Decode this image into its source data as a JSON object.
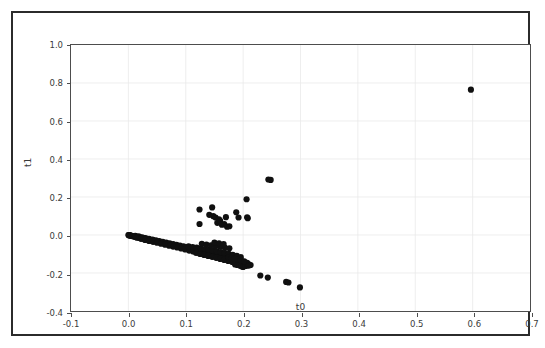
{
  "figure": {
    "background_color": "#ffffff",
    "frame_color": "#2b2b2b",
    "axes_color": "#4d4d4d",
    "grid_color": "#e9e9e9",
    "marker_color": "#101010"
  },
  "chart_data": {
    "type": "scatter",
    "title": "",
    "xlabel": "t0",
    "ylabel": "t1",
    "xlim": [
      -0.1,
      0.7
    ],
    "ylim": [
      -0.4,
      1.0
    ],
    "xticks": [
      -0.1,
      0.0,
      0.1,
      0.2,
      0.3,
      0.4,
      0.5,
      0.6,
      0.7
    ],
    "xticklabels": [
      "-0.1",
      "0.0",
      "0.1",
      "0.2",
      "0.3",
      "0.4",
      "0.5",
      "0.6",
      "0.7"
    ],
    "yticks": [
      -0.4,
      -0.2,
      0.0,
      0.2,
      0.4,
      0.6,
      0.8,
      1.0
    ],
    "yticklabels": [
      "-0.4",
      "-0.2",
      "0.0",
      "0.2",
      "0.4",
      "0.6",
      "0.8",
      "1.0"
    ],
    "grid": true,
    "legend": null,
    "marker": "o",
    "marker_size": 3.1,
    "series": [
      {
        "name": "points",
        "color": "#101010",
        "points": [
          [
            0.0,
            0.0
          ],
          [
            0.001,
            -0.001
          ],
          [
            0.002,
            -0.002
          ],
          [
            0.003,
            -0.002
          ],
          [
            0.004,
            -0.003
          ],
          [
            0.005,
            -0.004
          ],
          [
            0.006,
            -0.004
          ],
          [
            0.007,
            -0.005
          ],
          [
            0.008,
            -0.006
          ],
          [
            0.009,
            -0.006
          ],
          [
            0.01,
            -0.007
          ],
          [
            0.011,
            -0.008
          ],
          [
            0.012,
            -0.008
          ],
          [
            0.013,
            -0.009
          ],
          [
            0.014,
            -0.01
          ],
          [
            0.015,
            -0.01
          ],
          [
            0.016,
            -0.011
          ],
          [
            0.017,
            -0.012
          ],
          [
            0.018,
            -0.012
          ],
          [
            0.019,
            -0.013
          ],
          [
            0.02,
            -0.014
          ],
          [
            0.021,
            -0.014
          ],
          [
            0.022,
            -0.015
          ],
          [
            0.023,
            -0.016
          ],
          [
            0.024,
            -0.016
          ],
          [
            0.025,
            -0.017
          ],
          [
            0.026,
            -0.018
          ],
          [
            0.027,
            -0.018
          ],
          [
            0.028,
            -0.019
          ],
          [
            0.029,
            -0.02
          ],
          [
            0.03,
            -0.021
          ],
          [
            0.031,
            -0.021
          ],
          [
            0.032,
            -0.022
          ],
          [
            0.033,
            -0.023
          ],
          [
            0.034,
            -0.023
          ],
          [
            0.035,
            -0.024
          ],
          [
            0.036,
            -0.025
          ],
          [
            0.037,
            -0.025
          ],
          [
            0.038,
            -0.026
          ],
          [
            0.039,
            -0.027
          ],
          [
            0.04,
            -0.027
          ],
          [
            0.041,
            -0.028
          ],
          [
            0.042,
            -0.029
          ],
          [
            0.043,
            -0.03
          ],
          [
            0.044,
            -0.03
          ],
          [
            0.045,
            -0.031
          ],
          [
            0.046,
            -0.032
          ],
          [
            0.047,
            -0.032
          ],
          [
            0.048,
            -0.033
          ],
          [
            0.049,
            -0.034
          ],
          [
            0.05,
            -0.034
          ],
          [
            0.051,
            -0.035
          ],
          [
            0.052,
            -0.036
          ],
          [
            0.053,
            -0.037
          ],
          [
            0.054,
            -0.037
          ],
          [
            0.055,
            -0.038
          ],
          [
            0.056,
            -0.039
          ],
          [
            0.057,
            -0.039
          ],
          [
            0.058,
            -0.04
          ],
          [
            0.059,
            -0.041
          ],
          [
            0.06,
            -0.041
          ],
          [
            0.061,
            -0.042
          ],
          [
            0.062,
            -0.043
          ],
          [
            0.063,
            -0.044
          ],
          [
            0.064,
            -0.044
          ],
          [
            0.065,
            -0.045
          ],
          [
            0.066,
            -0.046
          ],
          [
            0.067,
            -0.046
          ],
          [
            0.068,
            -0.047
          ],
          [
            0.069,
            -0.048
          ],
          [
            0.07,
            -0.048
          ],
          [
            0.071,
            -0.049
          ],
          [
            0.072,
            -0.05
          ],
          [
            0.073,
            -0.051
          ],
          [
            0.074,
            -0.051
          ],
          [
            0.075,
            -0.052
          ],
          [
            0.076,
            -0.053
          ],
          [
            0.077,
            -0.053
          ],
          [
            0.078,
            -0.054
          ],
          [
            0.079,
            -0.055
          ],
          [
            0.08,
            -0.056
          ],
          [
            0.081,
            -0.056
          ],
          [
            0.082,
            -0.057
          ],
          [
            0.083,
            -0.058
          ],
          [
            0.084,
            -0.058
          ],
          [
            0.085,
            -0.059
          ],
          [
            0.086,
            -0.06
          ],
          [
            0.087,
            -0.06
          ],
          [
            0.088,
            -0.061
          ],
          [
            0.089,
            -0.062
          ],
          [
            0.09,
            -0.063
          ],
          [
            0.091,
            -0.063
          ],
          [
            0.092,
            -0.064
          ],
          [
            0.093,
            -0.065
          ],
          [
            0.094,
            -0.065
          ],
          [
            0.095,
            -0.066
          ],
          [
            0.096,
            -0.067
          ],
          [
            0.097,
            -0.067
          ],
          [
            0.098,
            -0.068
          ],
          [
            0.099,
            -0.069
          ],
          [
            0.1,
            -0.07
          ],
          [
            0.102,
            -0.071
          ],
          [
            0.104,
            -0.072
          ],
          [
            0.106,
            -0.074
          ],
          [
            0.108,
            -0.075
          ],
          [
            0.11,
            -0.077
          ],
          [
            0.112,
            -0.078
          ],
          [
            0.114,
            -0.08
          ],
          [
            0.116,
            -0.081
          ],
          [
            0.118,
            -0.083
          ],
          [
            0.12,
            -0.084
          ],
          [
            0.122,
            -0.086
          ],
          [
            0.124,
            -0.087
          ],
          [
            0.126,
            -0.088
          ],
          [
            0.128,
            -0.09
          ],
          [
            0.13,
            -0.091
          ],
          [
            0.132,
            -0.093
          ],
          [
            0.134,
            -0.094
          ],
          [
            0.136,
            -0.096
          ],
          [
            0.138,
            -0.097
          ],
          [
            0.14,
            -0.099
          ],
          [
            0.142,
            -0.1
          ],
          [
            0.144,
            -0.101
          ],
          [
            0.146,
            -0.103
          ],
          [
            0.148,
            -0.104
          ],
          [
            0.15,
            -0.106
          ],
          [
            0.152,
            -0.107
          ],
          [
            0.154,
            -0.109
          ],
          [
            0.156,
            -0.11
          ],
          [
            0.158,
            -0.112
          ],
          [
            0.16,
            -0.113
          ],
          [
            0.162,
            -0.114
          ],
          [
            0.164,
            -0.116
          ],
          [
            0.166,
            -0.117
          ],
          [
            0.168,
            -0.119
          ],
          [
            0.17,
            -0.12
          ],
          [
            0.172,
            -0.122
          ],
          [
            0.174,
            -0.123
          ],
          [
            0.176,
            -0.125
          ],
          [
            0.178,
            -0.126
          ],
          [
            0.18,
            -0.128
          ],
          [
            0.182,
            -0.129
          ],
          [
            0.184,
            -0.13
          ],
          [
            0.186,
            -0.132
          ],
          [
            0.188,
            -0.133
          ],
          [
            0.19,
            -0.135
          ],
          [
            0.192,
            -0.136
          ],
          [
            0.194,
            -0.138
          ],
          [
            0.196,
            -0.139
          ],
          [
            0.198,
            -0.141
          ],
          [
            0.2,
            -0.142
          ],
          [
            0.012,
            -0.004
          ],
          [
            0.018,
            -0.007
          ],
          [
            0.024,
            -0.012
          ],
          [
            0.03,
            -0.016
          ],
          [
            0.036,
            -0.02
          ],
          [
            0.042,
            -0.024
          ],
          [
            0.048,
            -0.028
          ],
          [
            0.054,
            -0.032
          ],
          [
            0.06,
            -0.036
          ],
          [
            0.066,
            -0.04
          ],
          [
            0.072,
            -0.044
          ],
          [
            0.078,
            -0.048
          ],
          [
            0.084,
            -0.052
          ],
          [
            0.09,
            -0.056
          ],
          [
            0.096,
            -0.06
          ],
          [
            0.102,
            -0.064
          ],
          [
            0.108,
            -0.068
          ],
          [
            0.114,
            -0.072
          ],
          [
            0.12,
            -0.076
          ],
          [
            0.126,
            -0.08
          ],
          [
            0.132,
            -0.084
          ],
          [
            0.138,
            -0.088
          ],
          [
            0.144,
            -0.092
          ],
          [
            0.15,
            -0.096
          ],
          [
            0.156,
            -0.1
          ],
          [
            0.162,
            -0.104
          ],
          [
            0.168,
            -0.108
          ],
          [
            0.174,
            -0.112
          ],
          [
            0.18,
            -0.116
          ],
          [
            0.186,
            -0.12
          ],
          [
            0.192,
            -0.124
          ],
          [
            0.015,
            -0.014
          ],
          [
            0.022,
            -0.02
          ],
          [
            0.029,
            -0.026
          ],
          [
            0.036,
            -0.031
          ],
          [
            0.043,
            -0.036
          ],
          [
            0.05,
            -0.041
          ],
          [
            0.057,
            -0.046
          ],
          [
            0.064,
            -0.051
          ],
          [
            0.071,
            -0.056
          ],
          [
            0.078,
            -0.061
          ],
          [
            0.085,
            -0.066
          ],
          [
            0.092,
            -0.071
          ],
          [
            0.099,
            -0.076
          ],
          [
            0.106,
            -0.082
          ],
          [
            0.113,
            -0.087
          ],
          [
            0.12,
            -0.093
          ],
          [
            0.127,
            -0.098
          ],
          [
            0.134,
            -0.103
          ],
          [
            0.141,
            -0.108
          ],
          [
            0.148,
            -0.113
          ],
          [
            0.155,
            -0.118
          ],
          [
            0.162,
            -0.123
          ],
          [
            0.169,
            -0.128
          ],
          [
            0.176,
            -0.133
          ],
          [
            0.183,
            -0.138
          ],
          [
            0.19,
            -0.143
          ],
          [
            0.196,
            -0.148
          ],
          [
            0.105,
            -0.06
          ],
          [
            0.112,
            -0.063
          ],
          [
            0.119,
            -0.066
          ],
          [
            0.126,
            -0.07
          ],
          [
            0.133,
            -0.074
          ],
          [
            0.14,
            -0.078
          ],
          [
            0.147,
            -0.082
          ],
          [
            0.154,
            -0.086
          ],
          [
            0.161,
            -0.09
          ],
          [
            0.168,
            -0.094
          ],
          [
            0.175,
            -0.099
          ],
          [
            0.182,
            -0.104
          ],
          [
            0.189,
            -0.11
          ],
          [
            0.196,
            -0.116
          ],
          [
            0.118,
            -0.095
          ],
          [
            0.125,
            -0.1
          ],
          [
            0.132,
            -0.105
          ],
          [
            0.139,
            -0.11
          ],
          [
            0.146,
            -0.115
          ],
          [
            0.153,
            -0.12
          ],
          [
            0.16,
            -0.126
          ],
          [
            0.167,
            -0.131
          ],
          [
            0.174,
            -0.137
          ],
          [
            0.181,
            -0.142
          ],
          [
            0.188,
            -0.148
          ],
          [
            0.195,
            -0.153
          ],
          [
            0.128,
            -0.046
          ],
          [
            0.136,
            -0.05
          ],
          [
            0.144,
            -0.054
          ],
          [
            0.152,
            -0.058
          ],
          [
            0.16,
            -0.062
          ],
          [
            0.168,
            -0.066
          ],
          [
            0.176,
            -0.07
          ],
          [
            0.15,
            -0.04
          ],
          [
            0.158,
            -0.044
          ],
          [
            0.166,
            -0.048
          ],
          [
            0.186,
            -0.155
          ],
          [
            0.19,
            -0.158
          ],
          [
            0.194,
            -0.16
          ],
          [
            0.198,
            -0.157
          ],
          [
            0.201,
            -0.152
          ],
          [
            0.203,
            -0.148
          ],
          [
            0.206,
            -0.156
          ],
          [
            0.208,
            -0.16
          ],
          [
            0.197,
            -0.165
          ],
          [
            0.2,
            -0.168
          ],
          [
            0.204,
            -0.163
          ],
          [
            0.205,
            -0.15
          ],
          [
            0.207,
            -0.146
          ],
          [
            0.21,
            -0.155
          ],
          [
            0.19,
            -0.128
          ],
          [
            0.196,
            -0.132
          ],
          [
            0.202,
            -0.138
          ],
          [
            0.175,
            -0.118
          ],
          [
            0.18,
            -0.122
          ],
          [
            0.185,
            -0.126
          ],
          [
            0.21,
            -0.16
          ],
          [
            0.213,
            -0.158
          ],
          [
            0.23,
            -0.213
          ],
          [
            0.243,
            -0.224
          ],
          [
            0.275,
            -0.247
          ],
          [
            0.279,
            -0.25
          ],
          [
            0.299,
            -0.276
          ],
          [
            0.124,
            0.134
          ],
          [
            0.124,
            0.058
          ],
          [
            0.141,
            0.106
          ],
          [
            0.146,
            0.145
          ],
          [
            0.148,
            0.099
          ],
          [
            0.152,
            0.092
          ],
          [
            0.155,
            0.064
          ],
          [
            0.158,
            0.082
          ],
          [
            0.16,
            0.074
          ],
          [
            0.163,
            0.054
          ],
          [
            0.167,
            0.057
          ],
          [
            0.17,
            0.094
          ],
          [
            0.172,
            0.044
          ],
          [
            0.176,
            0.046
          ],
          [
            0.188,
            0.12
          ],
          [
            0.192,
            0.092
          ],
          [
            0.206,
            0.188
          ],
          [
            0.207,
            0.093
          ],
          [
            0.208,
            0.088
          ],
          [
            0.244,
            0.292
          ],
          [
            0.248,
            0.29
          ],
          [
            0.597,
            0.765
          ]
        ]
      }
    ]
  }
}
